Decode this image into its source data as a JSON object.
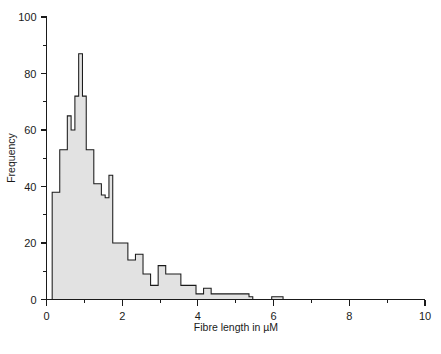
{
  "chart_data": {
    "type": "bar",
    "title": "",
    "subtitle": "",
    "xlabel": "Fibre length in µM",
    "ylabel": "Frequency",
    "xlim": [
      0,
      10
    ],
    "ylim": [
      0,
      100
    ],
    "grid": false,
    "legend": null,
    "bin_width": 0.1,
    "x_ticks_major": [
      0,
      2,
      4,
      6,
      8,
      10
    ],
    "x_ticks_major_labels": [
      "0",
      "2",
      "4",
      "6",
      "8",
      "10"
    ],
    "x_ticks_minor": [
      1,
      3,
      5,
      7,
      9
    ],
    "y_ticks_major": [
      0,
      20,
      40,
      60,
      80,
      100
    ],
    "y_ticks_major_labels": [
      "0",
      "20",
      "40",
      "60",
      "80",
      "100"
    ],
    "y_ticks_minor": [
      10,
      30,
      50,
      70,
      90
    ],
    "bin_starts": [
      0.15,
      0.25,
      0.35,
      0.45,
      0.55,
      0.65,
      0.75,
      0.85,
      0.95,
      1.05,
      1.15,
      1.25,
      1.35,
      1.45,
      1.55,
      1.65,
      1.75,
      1.85,
      1.95,
      2.05,
      2.15,
      2.25,
      2.35,
      2.45,
      2.55,
      2.65,
      2.75,
      2.85,
      2.95,
      3.05,
      3.15,
      3.25,
      3.35,
      3.45,
      3.55,
      3.65,
      3.75,
      3.85,
      3.95,
      4.05,
      4.15,
      4.25,
      4.35,
      4.45,
      4.55,
      4.65,
      4.75,
      4.85,
      4.95,
      5.05,
      5.15,
      5.25,
      5.35,
      5.45,
      5.55,
      5.65,
      5.75,
      5.85,
      5.95,
      6.05,
      6.15,
      6.25
    ],
    "values": [
      38,
      38,
      53,
      53,
      65,
      60,
      72,
      87,
      72,
      53,
      53,
      41,
      41,
      37,
      36,
      44,
      20,
      20,
      20,
      20,
      14,
      14,
      16,
      16,
      9,
      9,
      5,
      5,
      12,
      12,
      9,
      9,
      9,
      9,
      5,
      5,
      5,
      5,
      2,
      2,
      4,
      4,
      2,
      2,
      2,
      2,
      2,
      2,
      2,
      2,
      2,
      2,
      1,
      0,
      0,
      0,
      0,
      0,
      1,
      1,
      1,
      0
    ]
  },
  "axes": {
    "x_title": "Fibre length in µM",
    "y_title": "Frequency"
  }
}
